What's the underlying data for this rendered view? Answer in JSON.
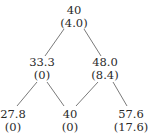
{
  "diagram": {
    "type": "binomial-tree",
    "nodes": [
      {
        "id": "root",
        "value": "40",
        "sub": "(4.0)",
        "x": 74,
        "y": 4
      },
      {
        "id": "down",
        "value": "33.3",
        "sub": "(0)",
        "x": 42,
        "y": 56
      },
      {
        "id": "up",
        "value": "48.0",
        "sub": "(8.4)",
        "x": 105,
        "y": 56
      },
      {
        "id": "down-down",
        "value": "27.8",
        "sub": "(0)",
        "x": 13,
        "y": 108
      },
      {
        "id": "up-down",
        "value": "40",
        "sub": "(0)",
        "x": 70,
        "y": 108
      },
      {
        "id": "up-up",
        "value": "57.6",
        "sub": "(17.6)",
        "x": 131,
        "y": 108
      }
    ],
    "edges": [
      {
        "from": "root",
        "to": "down",
        "x1": 64,
        "y1": 29,
        "x2": 45,
        "y2": 56
      },
      {
        "from": "root",
        "to": "up",
        "x1": 84,
        "y1": 29,
        "x2": 101,
        "y2": 56
      },
      {
        "from": "down",
        "to": "down-down",
        "x1": 37,
        "y1": 82,
        "x2": 17,
        "y2": 106
      },
      {
        "from": "down",
        "to": "up-down",
        "x1": 47,
        "y1": 82,
        "x2": 64,
        "y2": 106
      },
      {
        "from": "up",
        "to": "up-down",
        "x1": 98,
        "y1": 82,
        "x2": 76,
        "y2": 106
      },
      {
        "from": "up",
        "to": "up-up",
        "x1": 113,
        "y1": 82,
        "x2": 127,
        "y2": 106
      }
    ]
  }
}
